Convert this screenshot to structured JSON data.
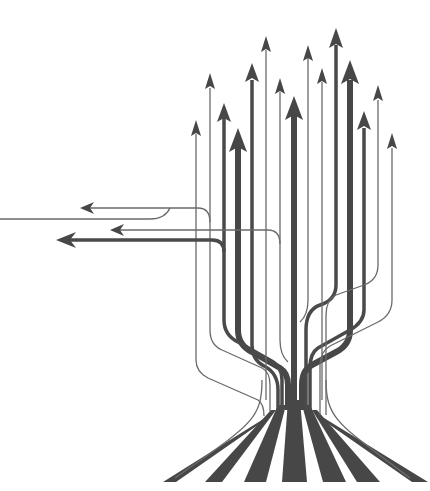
{
  "illustration": {
    "subject": "tree-of-arrows",
    "description": "Stylized tree formed by upward-pointing arrows branching from a trunk with flared roots; three arrows branch off to the left",
    "colors": {
      "background": "#ffffff",
      "stroke": "#474747",
      "thin_stroke": "#6a6a6a"
    },
    "up_arrows": [
      {
        "x": 196,
        "tip_y": 122,
        "weight": "thin"
      },
      {
        "x": 210,
        "tip_y": 75,
        "weight": "thin"
      },
      {
        "x": 224,
        "tip_y": 105,
        "weight": "med"
      },
      {
        "x": 238,
        "tip_y": 130,
        "weight": "thick"
      },
      {
        "x": 252,
        "tip_y": 65,
        "weight": "med"
      },
      {
        "x": 266,
        "tip_y": 38,
        "weight": "thin"
      },
      {
        "x": 280,
        "tip_y": 80,
        "weight": "thin"
      },
      {
        "x": 294,
        "tip_y": 98,
        "weight": "thick"
      },
      {
        "x": 308,
        "tip_y": 47,
        "weight": "thin"
      },
      {
        "x": 322,
        "tip_y": 70,
        "weight": "thin"
      },
      {
        "x": 336,
        "tip_y": 30,
        "weight": "med"
      },
      {
        "x": 350,
        "tip_y": 62,
        "weight": "thick"
      },
      {
        "x": 364,
        "tip_y": 113,
        "weight": "med"
      },
      {
        "x": 378,
        "tip_y": 87,
        "weight": "thin"
      },
      {
        "x": 392,
        "tip_y": 135,
        "weight": "thin"
      }
    ],
    "left_arrows": [
      {
        "tip_x": 82,
        "y": 208,
        "weight": "thin"
      },
      {
        "tip_x": 112,
        "y": 230,
        "weight": "thin"
      },
      {
        "tip_x": 58,
        "y": 240,
        "weight": "med"
      }
    ]
  }
}
